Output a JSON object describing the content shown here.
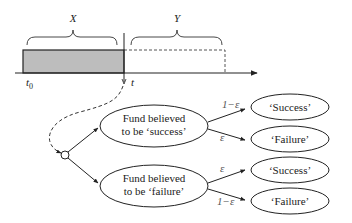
{
  "timeline": {
    "brace_x_label": "X",
    "brace_y_label": "Y",
    "t0_label": "t",
    "t0_subscript": "0",
    "t_label": "t"
  },
  "tree": {
    "root": {
      "shape": "circle"
    },
    "belief_nodes": [
      {
        "line1": "Fund believed",
        "line2": "to be ‘success’"
      },
      {
        "line1": "Fund believed",
        "line2": "to be ‘failure’"
      }
    ],
    "edges": [
      {
        "label": "1−ε"
      },
      {
        "label": "ε"
      },
      {
        "label": "ε"
      },
      {
        "label": "1−ε"
      }
    ],
    "outcomes": [
      {
        "label": "‘Success’"
      },
      {
        "label": "‘Failure’"
      },
      {
        "label": "‘Success’"
      },
      {
        "label": "‘Failure’"
      }
    ]
  },
  "colors": {
    "shaded_fill": "#bdbdbd",
    "stroke": "#222222",
    "dashed": "#555555"
  }
}
